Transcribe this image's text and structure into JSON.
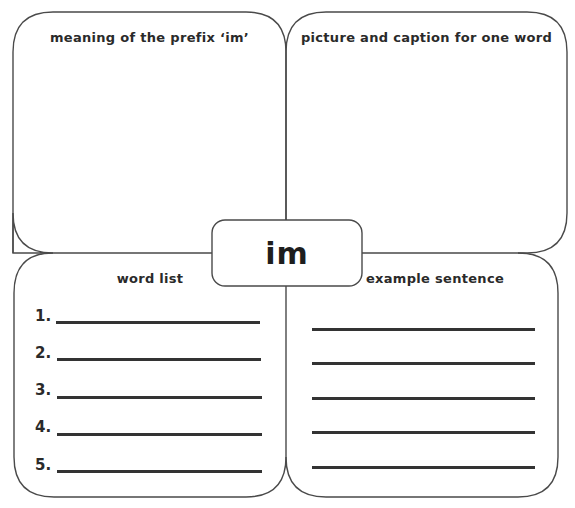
{
  "worksheet": {
    "center_prefix": "im",
    "panels": {
      "top_left": {
        "title": "meaning of the prefix ‘im’"
      },
      "top_right": {
        "title": "picture and caption for one word"
      },
      "bottom_left": {
        "title": "word list",
        "items": [
          {
            "number": "1."
          },
          {
            "number": "2."
          },
          {
            "number": "3."
          },
          {
            "number": "4."
          },
          {
            "number": "5."
          }
        ]
      },
      "bottom_right": {
        "title": "example sentence",
        "line_count": 5
      }
    },
    "colors": {
      "outline": "#444444",
      "text": "#2a2a2a",
      "background": "#ffffff"
    }
  }
}
